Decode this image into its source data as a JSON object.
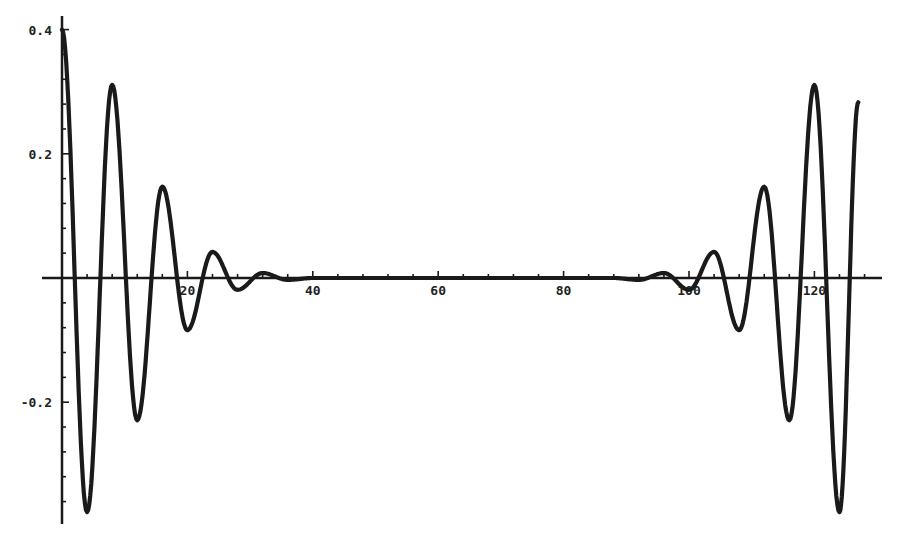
{
  "chart_data": {
    "type": "line",
    "title": "",
    "xlabel": "",
    "ylabel": "",
    "xlim": [
      -3,
      131
    ],
    "ylim": [
      -0.39,
      0.42
    ],
    "grid": false,
    "legend": null,
    "x_ticks": [
      20,
      40,
      60,
      80,
      100,
      120
    ],
    "x_tick_labels": [
      "20",
      "40",
      "60",
      "80",
      "100",
      "120"
    ],
    "y_ticks": [
      0.4,
      0.2,
      -0.2
    ],
    "y_tick_labels": [
      "0.4",
      "0.2",
      "-0.2"
    ],
    "series": [
      {
        "name": "signal",
        "color": "#1a1a1a",
        "x": [
          0,
          4,
          8,
          12,
          16,
          20,
          24,
          28,
          32,
          36,
          40,
          50,
          60,
          70,
          80,
          88,
          92,
          96,
          100,
          104,
          108,
          112,
          116,
          120,
          124,
          127
        ],
        "y": [
          0.4,
          -0.377,
          0.311,
          -0.229,
          0.147,
          -0.084,
          0.042,
          -0.019,
          0.008,
          -0.003,
          0.0,
          0.0,
          0.0,
          0.0,
          0.0,
          0.0,
          -0.003,
          0.008,
          -0.019,
          0.042,
          -0.084,
          0.147,
          -0.229,
          0.311,
          -0.377,
          0.283
        ]
      }
    ]
  }
}
